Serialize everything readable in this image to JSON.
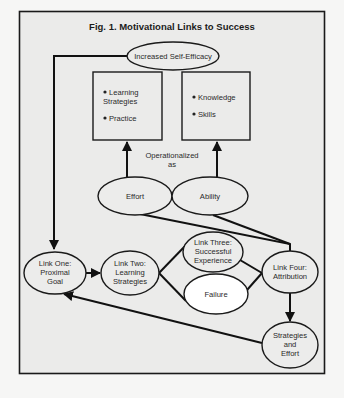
{
  "figure": {
    "title": "Fig. 1. Motivational Links to Success"
  },
  "nodes": {
    "self_efficacy": "Increased Self-Efficacy",
    "effort_box": {
      "items": [
        "Learning",
        "Strategies",
        "Practice"
      ]
    },
    "ability_box": {
      "items": [
        "Knowledge",
        "Skills"
      ]
    },
    "operationalized": [
      "Operationalized",
      "as"
    ],
    "effort": "Effort",
    "ability": "Ability",
    "link_one": [
      "Link One:",
      "Proximal",
      "Goal"
    ],
    "link_two": [
      "Link Two:",
      "Learning",
      "Strategies"
    ],
    "link_three": [
      "Link Three:",
      "Successful",
      "Experience"
    ],
    "failure": "Failure",
    "link_four": [
      "Link Four:",
      "Attribution"
    ],
    "strategies_effort": [
      "Strategies",
      "and",
      "Effort"
    ]
  },
  "colors": {
    "background": "#f6f6f5",
    "panel": "#ebebea",
    "stroke": "#111111",
    "failure_fill": "#ffffff"
  }
}
